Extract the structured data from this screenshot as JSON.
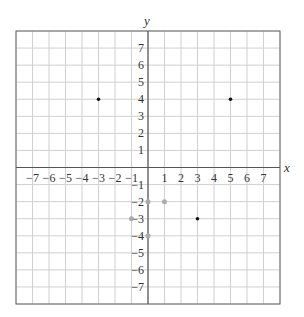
{
  "chart_data": {
    "type": "scatter",
    "title": "",
    "xlabel": "x",
    "ylabel": "y",
    "xlim": [
      -8,
      8
    ],
    "ylim": [
      -8,
      8
    ],
    "grid": true,
    "x_ticks": [
      -7,
      -6,
      -5,
      -4,
      -3,
      -2,
      -1,
      1,
      2,
      3,
      4,
      5,
      6,
      7
    ],
    "y_ticks": [
      7,
      6,
      5,
      4,
      3,
      2,
      1,
      -1,
      -2,
      -3,
      -4,
      -5,
      -6,
      -7
    ],
    "series": [
      {
        "name": "plotted points",
        "color": "#111111",
        "points": [
          [
            -3,
            4
          ],
          [
            5,
            4
          ],
          [
            3,
            -3
          ]
        ]
      },
      {
        "name": "faint points",
        "color": "#aaaaaa",
        "points": [
          [
            1,
            -2
          ],
          [
            0,
            -2
          ],
          [
            -1,
            -3
          ],
          [
            0,
            -4
          ]
        ]
      }
    ]
  }
}
